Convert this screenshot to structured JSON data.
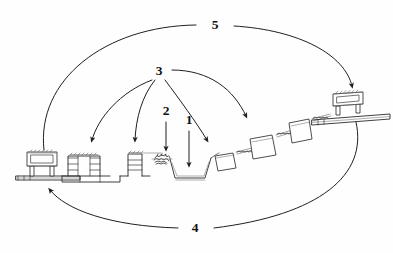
{
  "figure": {
    "background_color": "#fefefe",
    "ink_color": "#1f1f1f",
    "width": 393,
    "height": 253
  },
  "labels": [
    {
      "id": "label-1",
      "text": "1",
      "x": 189,
      "y": 120,
      "description": "points down into the trapezoidal channel / trench at the valley floor"
    },
    {
      "id": "label-2",
      "text": "2",
      "x": 166,
      "y": 111,
      "description": "points down at the dark scribbled vegetation / debris patch on the channel bank"
    },
    {
      "id": "label-3",
      "text": "3",
      "x": 159,
      "y": 72,
      "description": "fan of four curved arrows to the terrace wall structures"
    },
    {
      "id": "label-4",
      "text": "4",
      "x": 194,
      "y": 229,
      "description": "long lower arc sweeping from the right side to the leftmost platform"
    },
    {
      "id": "label-5",
      "text": "5",
      "x": 215,
      "y": 26,
      "description": "long upper arc sweeping from the left side to the rightmost platform building"
    }
  ],
  "callouts": [
    {
      "name": "callout-1",
      "label": "1",
      "kind": "straight-arrow",
      "from": [
        189,
        131
      ],
      "to": [
        189,
        168
      ]
    },
    {
      "name": "callout-2",
      "label": "2",
      "kind": "straight-arrow",
      "from": [
        166,
        122
      ],
      "to": [
        166,
        152
      ]
    },
    {
      "name": "callout-3",
      "label": "3",
      "kind": "curved-arrow-fan",
      "targets": 4
    },
    {
      "name": "callout-4",
      "label": "4",
      "kind": "curved-arc",
      "points_to": "left-platform"
    },
    {
      "name": "callout-5",
      "label": "5",
      "kind": "curved-arc",
      "points_to": "right-platform-building"
    }
  ],
  "structures": [
    {
      "name": "left-platform-building",
      "kind": "building-on-platform",
      "x": 20,
      "y": 150
    },
    {
      "name": "terrace-wall-stepped-a",
      "kind": "stepped-terrace-wall",
      "x": 62,
      "y": 150
    },
    {
      "name": "terrace-wall-stepped-b",
      "kind": "stepped-terrace-wall",
      "x": 128,
      "y": 150
    },
    {
      "name": "vegetation-patch",
      "kind": "scribbled-vegetation",
      "x": 160,
      "y": 155
    },
    {
      "name": "channel-trench",
      "kind": "trapezoidal-channel",
      "x": 172,
      "y": 160
    },
    {
      "name": "cascade-block-1",
      "kind": "stepped-block",
      "x": 218,
      "y": 145
    },
    {
      "name": "cascade-block-2",
      "kind": "stepped-block",
      "x": 252,
      "y": 128
    },
    {
      "name": "cascade-block-3",
      "kind": "stepped-block",
      "x": 288,
      "y": 113
    },
    {
      "name": "right-platform-building",
      "kind": "building-on-platform",
      "x": 335,
      "y": 95
    }
  ]
}
